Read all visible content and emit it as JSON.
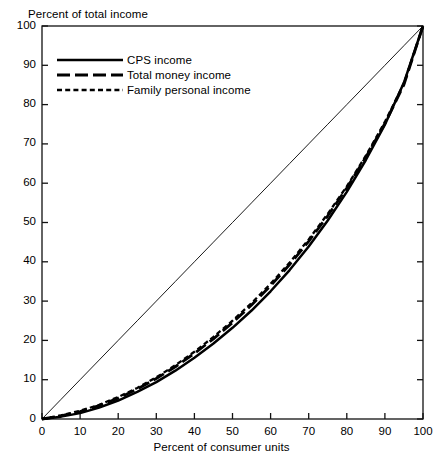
{
  "chart_data": {
    "type": "line",
    "title": "",
    "subtitle": "",
    "xlabel": "Percent of consumer units",
    "ylabel": "Percent of total income",
    "xlim": [
      0,
      100
    ],
    "ylim": [
      0,
      100
    ],
    "grid": false,
    "legend_position": "upper-left-inside",
    "x_ticks": [
      "0",
      "10",
      "20",
      "30",
      "40",
      "50",
      "60",
      "70",
      "80",
      "90",
      "100"
    ],
    "y_ticks": [
      "0",
      "10",
      "20",
      "30",
      "40",
      "50",
      "60",
      "70",
      "80",
      "90",
      "100"
    ],
    "x": [
      0,
      5,
      10,
      15,
      20,
      25,
      30,
      35,
      40,
      45,
      50,
      55,
      60,
      65,
      70,
      75,
      80,
      85,
      90,
      95,
      100
    ],
    "series": [
      {
        "name": "CPS income",
        "style": "solid",
        "color": "#000000",
        "values": [
          0,
          0.6,
          1.5,
          2.9,
          4.7,
          6.9,
          9.4,
          12.3,
          15.6,
          19.2,
          23.2,
          27.6,
          32.5,
          37.9,
          43.9,
          50.5,
          57.8,
          65.9,
          74.9,
          85.6,
          100
        ]
      },
      {
        "name": "Total money income",
        "style": "long-dash",
        "color": "#000000",
        "values": [
          0,
          0.8,
          1.9,
          3.4,
          5.3,
          7.6,
          10.3,
          13.3,
          16.7,
          20.4,
          24.5,
          29.0,
          33.9,
          39.3,
          45.2,
          51.7,
          58.8,
          66.6,
          75.2,
          85.1,
          100
        ]
      },
      {
        "name": "Family personal income",
        "style": "short-dash",
        "color": "#000000",
        "values": [
          0,
          0.9,
          2.1,
          3.6,
          5.6,
          7.9,
          10.6,
          13.7,
          17.1,
          20.9,
          25.0,
          29.5,
          34.4,
          39.8,
          45.7,
          52.2,
          59.2,
          67.0,
          75.6,
          85.4,
          100
        ]
      },
      {
        "name": "line of equality",
        "style": "thin-solid",
        "color": "#000000",
        "values": [
          0,
          5,
          10,
          15,
          20,
          25,
          30,
          35,
          40,
          45,
          50,
          55,
          60,
          65,
          70,
          75,
          80,
          85,
          90,
          95,
          100
        ]
      }
    ]
  },
  "axes": {
    "y_title": "Percent of total income",
    "x_title": "Percent of consumer units"
  },
  "legend": {
    "items": [
      {
        "label": "CPS income",
        "style": "solid"
      },
      {
        "label": "Total money income",
        "style": "long-dash"
      },
      {
        "label": "Family personal income",
        "style": "short-dash"
      }
    ]
  }
}
